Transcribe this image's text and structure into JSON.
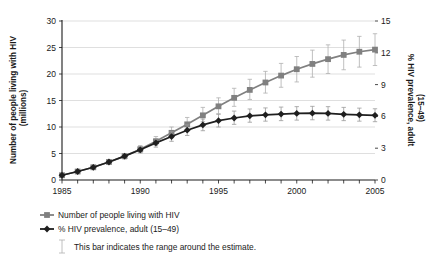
{
  "chart_data": {
    "type": "line",
    "title": "",
    "xlabel": "",
    "ylabel": "Number of people living with HIV (millions)",
    "ylabel_right": "% HIV prevalence, adult (15–49)",
    "x": [
      1985,
      1986,
      1987,
      1988,
      1989,
      1990,
      1991,
      1992,
      1993,
      1994,
      1995,
      1996,
      1997,
      1998,
      1999,
      2000,
      2001,
      2002,
      2003,
      2004,
      2005
    ],
    "xticks": [
      "1985",
      "1990",
      "1995",
      "2000",
      "2005"
    ],
    "xlim": [
      1985,
      2005
    ],
    "ylim": [
      0,
      30
    ],
    "yticks": [
      0,
      5,
      10,
      15,
      20,
      25,
      30
    ],
    "ylim_right": [
      0,
      15
    ],
    "yticks_right": [
      0,
      3,
      6,
      9,
      12,
      15
    ],
    "grid": true,
    "legend_position": "below",
    "series": [
      {
        "name": "Number of people living with HIV",
        "axis": "left",
        "color": "#808080",
        "marker": "square",
        "values": [
          0.9,
          1.6,
          2.4,
          3.4,
          4.5,
          5.8,
          7.3,
          8.9,
          10.5,
          12.2,
          13.9,
          15.5,
          17.0,
          18.4,
          19.7,
          20.9,
          21.9,
          22.8,
          23.6,
          24.2,
          24.6
        ],
        "lower": [
          0.8,
          1.4,
          2.1,
          3.0,
          4.0,
          5.2,
          6.5,
          8.0,
          9.4,
          11.0,
          12.5,
          13.9,
          15.2,
          16.4,
          17.5,
          18.5,
          19.4,
          20.1,
          20.8,
          21.3,
          21.6
        ],
        "upper": [
          1.0,
          1.8,
          2.7,
          3.8,
          5.0,
          6.5,
          8.2,
          10.0,
          11.8,
          13.7,
          15.5,
          17.3,
          19.0,
          20.5,
          22.0,
          23.3,
          24.5,
          25.5,
          26.4,
          27.1,
          27.6
        ]
      },
      {
        "name": "% HIV prevalence, adult (15–49)",
        "axis": "right",
        "color": "#1f1f1f",
        "marker": "diamond",
        "values": [
          0.45,
          0.8,
          1.2,
          1.7,
          2.25,
          2.85,
          3.5,
          4.1,
          4.7,
          5.2,
          5.6,
          5.85,
          6.05,
          6.15,
          6.22,
          6.28,
          6.3,
          6.28,
          6.2,
          6.15,
          6.1
        ],
        "lower": [
          0.4,
          0.7,
          1.05,
          1.5,
          2.0,
          2.55,
          3.1,
          3.65,
          4.2,
          4.65,
          5.0,
          5.25,
          5.45,
          5.55,
          5.6,
          5.65,
          5.68,
          5.65,
          5.6,
          5.55,
          5.5
        ],
        "upper": [
          0.5,
          0.9,
          1.35,
          1.9,
          2.5,
          3.15,
          3.9,
          4.55,
          5.2,
          5.75,
          6.2,
          6.5,
          6.7,
          6.8,
          6.88,
          6.92,
          6.95,
          6.92,
          6.85,
          6.78,
          6.72
        ]
      }
    ]
  },
  "legend": {
    "items": [
      {
        "label": "Number of people living with HIV",
        "color": "#808080",
        "marker": "square"
      },
      {
        "label": "% HIV prevalence, adult (15–49)",
        "color": "#1f1f1f",
        "marker": "diamond"
      }
    ]
  },
  "note": {
    "text": "This bar indicates the range around the estimate."
  }
}
